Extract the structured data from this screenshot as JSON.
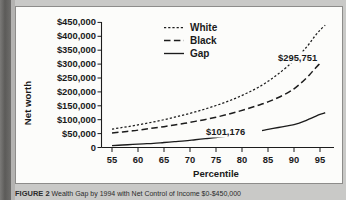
{
  "figure": {
    "caption_label": "FIGURE 2",
    "caption_text": "Wealth Gap by 1994 with Net Control of Income $0-$450,000"
  },
  "chart_data": {
    "type": "line",
    "title": "",
    "xlabel": "Percentile",
    "ylabel": "Net worth",
    "xlim": [
      53,
      98
    ],
    "ylim": [
      0,
      450000
    ],
    "grid": false,
    "legend_position": "top-center",
    "x_ticks": [
      55,
      60,
      65,
      70,
      75,
      80,
      85,
      90,
      95
    ],
    "x_tick_labels": [
      "55",
      "60",
      "65",
      "70",
      "75",
      "80",
      "85",
      "90",
      "95"
    ],
    "y_ticks": [
      0,
      50000,
      100000,
      150000,
      200000,
      250000,
      300000,
      350000,
      400000,
      450000
    ],
    "y_tick_labels": [
      "0",
      "$50,000",
      "$100,000",
      "$150,000",
      "$200,000",
      "$250,000",
      "$300,000",
      "$350,000",
      "$400,000",
      "$450,000"
    ],
    "x": [
      55,
      57,
      59,
      61,
      63,
      65,
      67,
      69,
      71,
      73,
      75,
      77,
      79,
      81,
      83,
      85,
      87,
      89,
      90,
      91,
      92,
      93,
      94,
      95,
      96
    ],
    "series": [
      {
        "name": "White",
        "style": "dotted",
        "values": [
          66000,
          72000,
          78000,
          85000,
          92000,
          100000,
          109000,
          118000,
          128000,
          139000,
          151000,
          164000,
          179000,
          196000,
          215000,
          238000,
          265000,
          296000,
          313000,
          332000,
          352000,
          375000,
          400000,
          422000,
          440000
        ]
      },
      {
        "name": "Black",
        "style": "dashed",
        "values": [
          52000,
          56000,
          60000,
          65000,
          70000,
          75000,
          81000,
          87000,
          94000,
          101000,
          109000,
          118000,
          128000,
          139000,
          151000,
          164000,
          180000,
          199000,
          211000,
          226000,
          243000,
          262000,
          283000,
          303000,
          320000
        ]
      },
      {
        "name": "Gap",
        "style": "solid",
        "values": [
          7000,
          9000,
          11000,
          13000,
          15000,
          18000,
          21000,
          24000,
          28000,
          32000,
          36000,
          41000,
          46000,
          52000,
          58000,
          65000,
          72000,
          79000,
          82000,
          88000,
          95000,
          103000,
          111000,
          119000,
          125000
        ]
      }
    ],
    "annotations": [
      {
        "name": "black-series-endpoint-label",
        "text": "$295,751",
        "x": 93.0,
        "y": 330000
      },
      {
        "name": "gap-series-label",
        "text": "$101,176",
        "x": 80.5,
        "y": 103000
      }
    ],
    "legend": [
      {
        "label": "White",
        "style": "dotted"
      },
      {
        "label": "Black",
        "style": "dashed"
      },
      {
        "label": "Gap",
        "style": "solid"
      }
    ]
  }
}
